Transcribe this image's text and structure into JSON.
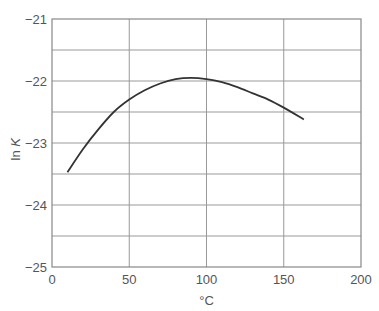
{
  "chart_data": {
    "type": "line",
    "title": "",
    "xlabel": "°C",
    "ylabel": "ln K",
    "xlim": [
      0,
      200
    ],
    "ylim": [
      -25,
      -21
    ],
    "x_ticks": [
      0,
      50,
      100,
      150,
      200
    ],
    "x_tick_labels": [
      "0",
      "50",
      "100",
      "150",
      "200"
    ],
    "y_ticks": [
      -25,
      -24,
      -23,
      -22,
      -21
    ],
    "y_tick_labels": [
      "−25",
      "−24",
      "−23",
      "−22",
      "−21"
    ],
    "grid": true,
    "grid_y_minor_step": 0.5,
    "legend": null,
    "series": [
      {
        "name": "ln K",
        "color": "#333333",
        "x": [
          10,
          20,
          30,
          40,
          50,
          60,
          70,
          80,
          90,
          100,
          110,
          120,
          130,
          140,
          150,
          163
        ],
        "y": [
          -23.47,
          -23.1,
          -22.78,
          -22.5,
          -22.3,
          -22.15,
          -22.04,
          -21.97,
          -21.95,
          -21.97,
          -22.02,
          -22.1,
          -22.2,
          -22.3,
          -22.43,
          -22.62
        ]
      }
    ]
  },
  "axes": {
    "x_label": "°C",
    "y_label_prefix": "ln ",
    "y_label_var": "K"
  }
}
